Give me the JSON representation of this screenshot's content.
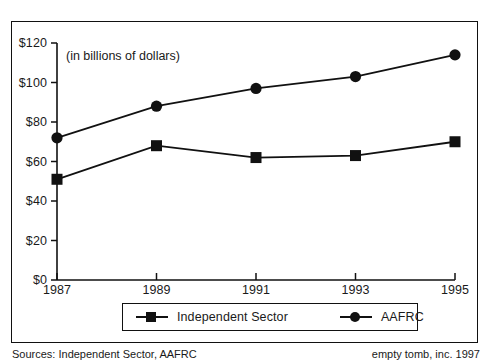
{
  "annotation": {
    "units_note": "(in billions of dollars)"
  },
  "legend": {
    "entries": [
      {
        "label": "Independent Sector",
        "marker": "square-marker"
      },
      {
        "label": "AAFRC",
        "marker": "circle-marker"
      }
    ]
  },
  "footer": {
    "sources": "Sources: Independent Sector, AAFRC",
    "credit": "empty tomb, inc. 1997"
  },
  "chart_data": {
    "type": "line",
    "title": "",
    "subtitle": "",
    "annotation": "(in billions of dollars)",
    "xlabel": "",
    "ylabel": "",
    "x": [
      1987,
      1989,
      1991,
      1993,
      1995
    ],
    "categories": [
      "1987",
      "1989",
      "1991",
      "1993",
      "1995"
    ],
    "xtick_labels": [
      "1987",
      "1989",
      "1991",
      "1993",
      "1995"
    ],
    "ytick_labels": [
      "$0",
      "$20",
      "$40",
      "$60",
      "$80",
      "$100",
      "$120"
    ],
    "ytick_values": [
      0,
      20,
      40,
      60,
      80,
      100,
      120
    ],
    "ylim": [
      0,
      120
    ],
    "xlim": [
      1987,
      1995
    ],
    "grid": false,
    "legend_position": "bottom",
    "series": [
      {
        "name": "Independent Sector",
        "marker": "square",
        "color": "#111111",
        "values": [
          51,
          68,
          62,
          63,
          70
        ]
      },
      {
        "name": "AAFRC",
        "marker": "circle",
        "color": "#111111",
        "values": [
          72,
          88,
          97,
          103,
          114
        ]
      }
    ]
  }
}
